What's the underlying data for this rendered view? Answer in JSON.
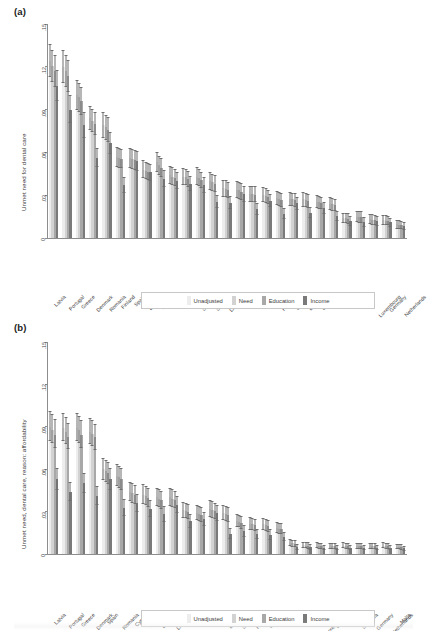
{
  "figure": {
    "panel_a_label": "(a)",
    "panel_b_label": "(b)"
  },
  "legend": {
    "items": [
      {
        "label": "Unadjusted",
        "color": "#ededed"
      },
      {
        "label": "Need",
        "color": "#d2d2d2"
      },
      {
        "label": "Education",
        "color": "#a8a8a8"
      },
      {
        "label": "Income",
        "color": "#7a7a7a"
      }
    ]
  },
  "chart_data": [
    {
      "type": "bar",
      "panel": "(a)",
      "title": "",
      "xlabel": "",
      "ylabel": "Unmet need for dental care",
      "ylim": [
        0,
        0.15
      ],
      "yticks": [
        0,
        0.03,
        0.06,
        0.09,
        0.12,
        0.15
      ],
      "ytick_labels": [
        "0",
        ".03",
        ".06",
        ".09",
        ".12",
        ".15"
      ],
      "grid": false,
      "legend_position": "bottom",
      "categories": [
        "Latvia",
        "Portugal",
        "Greece",
        "Denmark",
        "Romania",
        "Finland",
        "Spain",
        "Belgium",
        "Estonia",
        "Cyprus",
        "France",
        "Slovenia",
        "Slovakia",
        "Lithuania",
        "Ireland",
        "Poland",
        "Italy",
        "Hungary",
        "Sweden",
        "Bulgaria",
        "Czechia",
        "Croatia",
        "Austria",
        "Malta",
        "Luxembourg",
        "Germany",
        "Netherlands"
      ],
      "series": [
        {
          "name": "Unadjusted",
          "values": [
            0.124,
            0.12,
            0.1,
            0.084,
            0.079,
            0.057,
            0.056,
            0.048,
            0.053,
            0.044,
            0.043,
            0.043,
            0.04,
            0.035,
            0.034,
            0.031,
            0.03,
            0.028,
            0.0275,
            0.027,
            0.0255,
            0.024,
            0.014,
            0.015,
            0.013,
            0.0125,
            0.0095
          ],
          "err_low": [
            0.113,
            0.109,
            0.09,
            0.076,
            0.07,
            0.05,
            0.049,
            0.042,
            0.046,
            0.038,
            0.0375,
            0.037,
            0.034,
            0.029,
            0.028,
            0.0255,
            0.025,
            0.023,
            0.0225,
            0.022,
            0.021,
            0.0195,
            0.0105,
            0.011,
            0.0095,
            0.0092,
            0.0065
          ],
          "err_high": [
            0.136,
            0.132,
            0.1105,
            0.0925,
            0.088,
            0.064,
            0.063,
            0.0545,
            0.06,
            0.0505,
            0.049,
            0.0495,
            0.046,
            0.041,
            0.04,
            0.0368,
            0.0355,
            0.0332,
            0.0325,
            0.032,
            0.0302,
            0.0288,
            0.0178,
            0.0192,
            0.0168,
            0.016,
            0.0128
          ]
        },
        {
          "name": "Need",
          "values": [
            0.1205,
            0.117,
            0.0985,
            0.082,
            0.0775,
            0.056,
            0.0555,
            0.047,
            0.051,
            0.043,
            0.0425,
            0.042,
            0.039,
            0.0345,
            0.0335,
            0.031,
            0.0295,
            0.0275,
            0.027,
            0.0265,
            0.025,
            0.0235,
            0.0138,
            0.0148,
            0.0128,
            0.0122,
            0.0093
          ],
          "err_low": [
            0.1095,
            0.106,
            0.0885,
            0.074,
            0.069,
            0.0492,
            0.0485,
            0.0412,
            0.0442,
            0.0372,
            0.037,
            0.0362,
            0.0332,
            0.0286,
            0.0276,
            0.0255,
            0.0246,
            0.0226,
            0.0221,
            0.0216,
            0.0206,
            0.0191,
            0.0103,
            0.0108,
            0.0094,
            0.009,
            0.0064
          ],
          "err_high": [
            0.132,
            0.1285,
            0.109,
            0.0905,
            0.0865,
            0.063,
            0.0625,
            0.0535,
            0.0578,
            0.0495,
            0.0483,
            0.0483,
            0.045,
            0.0405,
            0.0395,
            0.0368,
            0.0348,
            0.0326,
            0.0319,
            0.0314,
            0.0296,
            0.0282,
            0.0176,
            0.019,
            0.0166,
            0.0158,
            0.0126
          ]
        },
        {
          "name": "Education",
          "values": [
            0.117,
            0.1135,
            0.096,
            0.08,
            0.076,
            0.0555,
            0.0545,
            0.0465,
            0.049,
            0.042,
            0.0415,
            0.0405,
            0.038,
            0.0335,
            0.0325,
            0.0305,
            0.0288,
            0.0268,
            0.0265,
            0.0258,
            0.0243,
            0.0228,
            0.0135,
            0.0145,
            0.0125,
            0.012,
            0.0091
          ],
          "err_low": [
            0.106,
            0.1025,
            0.0862,
            0.0722,
            0.0676,
            0.0488,
            0.0478,
            0.0408,
            0.0425,
            0.0363,
            0.0361,
            0.035,
            0.0324,
            0.0278,
            0.0268,
            0.0251,
            0.024,
            0.022,
            0.0217,
            0.0211,
            0.02,
            0.0186,
            0.01,
            0.0106,
            0.0092,
            0.0088,
            0.0062
          ],
          "err_high": [
            0.1285,
            0.125,
            0.1062,
            0.0882,
            0.0848,
            0.0624,
            0.0614,
            0.0528,
            0.0558,
            0.0482,
            0.0472,
            0.0466,
            0.044,
            0.0395,
            0.0385,
            0.0362,
            0.034,
            0.0318,
            0.0314,
            0.0307,
            0.0288,
            0.0272,
            0.0172,
            0.0186,
            0.0162,
            0.0154,
            0.0122
          ]
        },
        {
          "name": "Income",
          "values": [
            0.1065,
            0.09,
            0.079,
            0.056,
            0.0665,
            0.037,
            0.054,
            0.046,
            0.0415,
            0.0402,
            0.038,
            0.0372,
            0.0255,
            0.0248,
            0.031,
            0.02,
            0.0262,
            0.017,
            0.0242,
            0.0178,
            0.0208,
            0.0155,
            0.0118,
            0.0112,
            0.0118,
            0.011,
            0.0085
          ],
          "err_low": [
            0.096,
            0.0805,
            0.07,
            0.0495,
            0.059,
            0.0315,
            0.0472,
            0.0402,
            0.0358,
            0.0345,
            0.0328,
            0.0318,
            0.0208,
            0.02,
            0.0254,
            0.0158,
            0.0215,
            0.0133,
            0.0196,
            0.014,
            0.0168,
            0.0122,
            0.0086,
            0.008,
            0.0085,
            0.0079,
            0.0058
          ],
          "err_high": [
            0.1178,
            0.1,
            0.0882,
            0.0628,
            0.0742,
            0.0428,
            0.061,
            0.0522,
            0.0475,
            0.0462,
            0.0435,
            0.0428,
            0.0305,
            0.0298,
            0.0368,
            0.0244,
            0.031,
            0.0208,
            0.029,
            0.0218,
            0.025,
            0.019,
            0.0152,
            0.0146,
            0.0153,
            0.0142,
            0.0115
          ]
        }
      ]
    },
    {
      "type": "bar",
      "panel": "(b)",
      "title": "",
      "xlabel": "",
      "ylabel": "Unmet need, dental care, reason: affordability",
      "ylim": [
        0,
        0.15
      ],
      "yticks": [
        0,
        0.03,
        0.06,
        0.09,
        0.12,
        0.15
      ],
      "ytick_labels": [
        "0",
        ".03",
        ".06",
        ".09",
        ".12",
        ".15"
      ],
      "grid": false,
      "legend_position": "bottom",
      "categories": [
        "Latvia",
        "Portugal",
        "Greece",
        "Denmark",
        "Spain",
        "Romania",
        "Cyprus",
        "Estonia",
        "Belgium",
        "Lithuania",
        "Italy",
        "France",
        "Ireland",
        "Bulgaria",
        "Slovakia",
        "Hungary",
        "Sweden",
        "Poland",
        "Croatia",
        "Austria",
        "Luxembourg",
        "Czechia",
        "Finland",
        "Slovenia",
        "Germany",
        "Netherlands",
        "Malta"
      ],
      "series": [
        {
          "name": "Unadjusted",
          "values": [
            0.09,
            0.089,
            0.0895,
            0.0865,
            0.06,
            0.0555,
            0.044,
            0.042,
            0.04,
            0.04,
            0.031,
            0.029,
            0.032,
            0.029,
            0.0235,
            0.0215,
            0.021,
            0.0185,
            0.0078,
            0.0062,
            0.006,
            0.0058,
            0.006,
            0.0058,
            0.0058,
            0.006,
            0.0052
          ],
          "err_low": [
            0.08,
            0.08,
            0.08,
            0.0775,
            0.0525,
            0.048,
            0.0372,
            0.0355,
            0.034,
            0.034,
            0.0258,
            0.024,
            0.0265,
            0.0238,
            0.0192,
            0.0172,
            0.0168,
            0.0148,
            0.0055,
            0.0042,
            0.004,
            0.0039,
            0.004,
            0.0039,
            0.0038,
            0.004,
            0.0034
          ],
          "err_high": [
            0.101,
            0.0995,
            0.1,
            0.0962,
            0.0682,
            0.0635,
            0.0512,
            0.0492,
            0.0468,
            0.0468,
            0.0368,
            0.0345,
            0.038,
            0.0345,
            0.0282,
            0.0262,
            0.0255,
            0.0228,
            0.0104,
            0.0086,
            0.0082,
            0.008,
            0.0082,
            0.008,
            0.008,
            0.0082,
            0.0072
          ]
        },
        {
          "name": "Need",
          "values": [
            0.088,
            0.0865,
            0.0875,
            0.085,
            0.0585,
            0.0545,
            0.043,
            0.041,
            0.0392,
            0.0392,
            0.0305,
            0.0285,
            0.0312,
            0.0282,
            0.023,
            0.021,
            0.0205,
            0.018,
            0.0075,
            0.006,
            0.0058,
            0.0056,
            0.0058,
            0.0056,
            0.0056,
            0.0058,
            0.005
          ],
          "err_low": [
            0.0782,
            0.0775,
            0.0782,
            0.0762,
            0.0512,
            0.047,
            0.0364,
            0.0346,
            0.0332,
            0.0332,
            0.0253,
            0.0235,
            0.0258,
            0.0231,
            0.0188,
            0.0168,
            0.0164,
            0.0144,
            0.0053,
            0.004,
            0.0039,
            0.0038,
            0.0039,
            0.0038,
            0.0037,
            0.0039,
            0.0033
          ],
          "err_high": [
            0.0988,
            0.0968,
            0.098,
            0.0946,
            0.0665,
            0.0625,
            0.05,
            0.048,
            0.0458,
            0.0458,
            0.0362,
            0.034,
            0.0372,
            0.0338,
            0.0276,
            0.0256,
            0.025,
            0.0222,
            0.01,
            0.0084,
            0.008,
            0.0078,
            0.008,
            0.0078,
            0.0078,
            0.008,
            0.007
          ]
        },
        {
          "name": "Education",
          "values": [
            0.0845,
            0.083,
            0.0845,
            0.0825,
            0.057,
            0.053,
            0.042,
            0.0398,
            0.0382,
            0.0384,
            0.0298,
            0.0278,
            0.0305,
            0.0274,
            0.0222,
            0.0204,
            0.02,
            0.0175,
            0.0073,
            0.0058,
            0.0056,
            0.0054,
            0.0056,
            0.0054,
            0.0054,
            0.0056,
            0.0048
          ],
          "err_low": [
            0.0748,
            0.0742,
            0.0752,
            0.0736,
            0.0498,
            0.0456,
            0.0354,
            0.0335,
            0.0322,
            0.0324,
            0.0246,
            0.0228,
            0.0251,
            0.0223,
            0.018,
            0.0162,
            0.0159,
            0.0139,
            0.0051,
            0.0038,
            0.0037,
            0.0036,
            0.0037,
            0.0036,
            0.0035,
            0.0037,
            0.0031
          ],
          "err_high": [
            0.0952,
            0.0928,
            0.0948,
            0.092,
            0.065,
            0.0608,
            0.0488,
            0.0466,
            0.0446,
            0.0448,
            0.0354,
            0.0332,
            0.0364,
            0.033,
            0.0268,
            0.025,
            0.0244,
            0.0216,
            0.0098,
            0.0082,
            0.0078,
            0.0076,
            0.0078,
            0.0076,
            0.0076,
            0.0078,
            0.0068
          ]
        },
        {
          "name": "Income",
          "values": [
            0.053,
            0.044,
            0.05,
            0.0412,
            0.053,
            0.0325,
            0.036,
            0.032,
            0.0282,
            0.035,
            0.0232,
            0.0245,
            0.029,
            0.0145,
            0.016,
            0.014,
            0.0135,
            0.012,
            0.005,
            0.0048,
            0.0046,
            0.0044,
            0.0046,
            0.0044,
            0.0044,
            0.0046,
            0.004
          ],
          "err_low": [
            0.0455,
            0.0372,
            0.043,
            0.0348,
            0.0455,
            0.0268,
            0.03,
            0.0262,
            0.023,
            0.0292,
            0.0185,
            0.0196,
            0.0236,
            0.0108,
            0.0122,
            0.0104,
            0.01,
            0.009,
            0.0031,
            0.0029,
            0.0028,
            0.0026,
            0.0028,
            0.0026,
            0.0026,
            0.0028,
            0.0024
          ],
          "err_high": [
            0.0612,
            0.0512,
            0.0575,
            0.048,
            0.0612,
            0.0386,
            0.0425,
            0.0382,
            0.0338,
            0.0412,
            0.0282,
            0.0298,
            0.0348,
            0.0185,
            0.0202,
            0.018,
            0.0174,
            0.0154,
            0.0072,
            0.007,
            0.0067,
            0.0065,
            0.0067,
            0.0065,
            0.0065,
            0.0067,
            0.0058
          ]
        }
      ]
    }
  ]
}
